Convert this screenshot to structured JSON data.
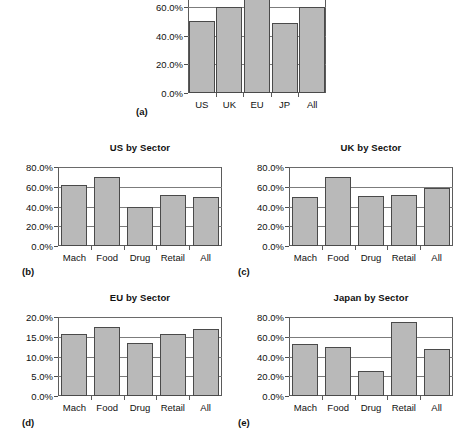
{
  "figure": {
    "panel_letters": [
      "(a)",
      "(b)",
      "(c)",
      "(d)",
      "(e)"
    ]
  },
  "chart_data": [
    {
      "panel": "(a)",
      "type": "bar",
      "title": "",
      "categories": [
        "US",
        "UK",
        "EU",
        "JP",
        "All"
      ],
      "values": [
        50.0,
        60.0,
        68.0,
        49.0,
        60.0
      ],
      "tick_labels": [
        "0.0%",
        "20.0%",
        "40.0%",
        "60.0%",
        "80.0%"
      ],
      "ticks": [
        0,
        20,
        40,
        60,
        80
      ],
      "ylim": [
        0,
        80
      ],
      "xlabel": "",
      "ylabel": "",
      "grid": true,
      "legend": "none",
      "note": "top of plot frame cropped by screenshot edge"
    },
    {
      "panel": "(b)",
      "type": "bar",
      "title": "US by Sector",
      "categories": [
        "Mach",
        "Food",
        "Drug",
        "Retail",
        "All"
      ],
      "values": [
        62.0,
        70.0,
        39.0,
        52.0,
        50.0
      ],
      "tick_labels": [
        "0.0%",
        "20.0%",
        "40.0%",
        "60.0%",
        "80.0%"
      ],
      "ticks": [
        0,
        20,
        40,
        60,
        80
      ],
      "ylim": [
        0,
        80
      ],
      "xlabel": "",
      "ylabel": "",
      "grid": true,
      "legend": "none"
    },
    {
      "panel": "(c)",
      "type": "bar",
      "title": "UK by Sector",
      "categories": [
        "Mach",
        "Food",
        "Drug",
        "Retail",
        "All"
      ],
      "values": [
        50.0,
        70.0,
        51.0,
        52.0,
        59.0
      ],
      "tick_labels": [
        "0.0%",
        "20.0%",
        "40.0%",
        "60.0%",
        "80.0%"
      ],
      "ticks": [
        0,
        20,
        40,
        60,
        80
      ],
      "ylim": [
        0,
        80
      ],
      "xlabel": "",
      "ylabel": "",
      "grid": true,
      "legend": "none"
    },
    {
      "panel": "(d)",
      "type": "bar",
      "title": "EU by Sector",
      "categories": [
        "Mach",
        "Food",
        "Drug",
        "Retail",
        "All"
      ],
      "values": [
        15.8,
        17.5,
        13.5,
        15.8,
        17.0
      ],
      "tick_labels": [
        "0.0%",
        "5.0%",
        "10.0%",
        "15.0%",
        "20.0%"
      ],
      "ticks": [
        0,
        5,
        10,
        15,
        20
      ],
      "ylim": [
        0,
        20
      ],
      "xlabel": "",
      "ylabel": "",
      "grid": true,
      "legend": "none"
    },
    {
      "panel": "(e)",
      "type": "bar",
      "title": "Japan by Sector",
      "categories": [
        "Mach",
        "Food",
        "Drug",
        "Retail",
        "All"
      ],
      "values": [
        53.0,
        50.0,
        25.0,
        75.0,
        48.0
      ],
      "tick_labels": [
        "0.0%",
        "20.0%",
        "40.0%",
        "60.0%",
        "80.0%"
      ],
      "ticks": [
        0,
        20,
        40,
        60,
        80
      ],
      "ylim": [
        0,
        80
      ],
      "xlabel": "",
      "ylabel": "",
      "grid": true,
      "legend": "none"
    }
  ]
}
